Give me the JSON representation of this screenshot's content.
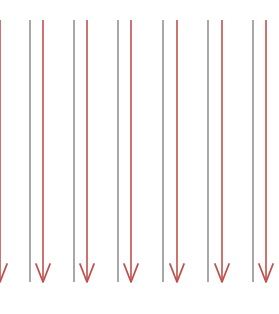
{
  "diagram": {
    "colors": {
      "background": "#ffffff",
      "gray_line": "#7a7a7a",
      "red_arrow": "#c0504d"
    },
    "line_top": 20,
    "line_bottom": 282,
    "arrowhead_height": 18,
    "arrowhead_half_width": 7,
    "gray_lines_x": [
      30,
      74,
      118,
      163,
      208,
      253
    ],
    "red_arrows_x": [
      0,
      43,
      87,
      131,
      177,
      222,
      266
    ]
  }
}
